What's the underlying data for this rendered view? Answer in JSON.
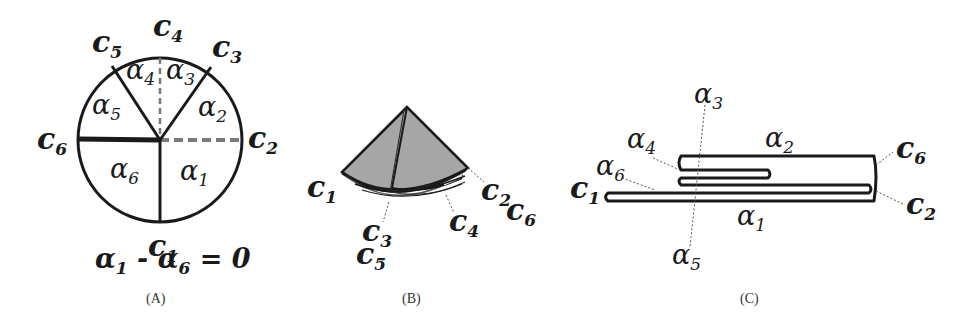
{
  "panels": {
    "a": {
      "caption": "(A)",
      "corner_labels": [
        {
          "base": "c",
          "sub": "1"
        },
        {
          "base": "c",
          "sub": "2"
        },
        {
          "base": "c",
          "sub": "3"
        },
        {
          "base": "c",
          "sub": "4"
        },
        {
          "base": "c",
          "sub": "5"
        },
        {
          "base": "c",
          "sub": "6"
        }
      ],
      "angle_labels": [
        {
          "base": "α",
          "sub": "1"
        },
        {
          "base": "α",
          "sub": "2"
        },
        {
          "base": "α",
          "sub": "3"
        },
        {
          "base": "α",
          "sub": "4"
        },
        {
          "base": "α",
          "sub": "5"
        },
        {
          "base": "α",
          "sub": "6"
        }
      ],
      "equation": {
        "lhs_a": "α",
        "lhs_a_sub": "1",
        "minus": " - ",
        "lhs_b": "α",
        "lhs_b_sub": "6",
        "rhs": " = 0"
      }
    },
    "b": {
      "caption": "(B)",
      "labels": [
        {
          "base": "c",
          "sub": "1"
        },
        {
          "base": "c",
          "sub": "2"
        },
        {
          "base": "c",
          "sub": "6"
        },
        {
          "base": "c",
          "sub": "3"
        },
        {
          "base": "c",
          "sub": "5"
        },
        {
          "base": "c",
          "sub": "4"
        }
      ]
    },
    "c": {
      "caption": "(C)",
      "labels": [
        {
          "base": "α",
          "sub": "3"
        },
        {
          "base": "α",
          "sub": "4"
        },
        {
          "base": "α",
          "sub": "2"
        },
        {
          "base": "α",
          "sub": "6"
        },
        {
          "base": "α",
          "sub": "1"
        },
        {
          "base": "α",
          "sub": "5"
        },
        {
          "base": "c",
          "sub": "1"
        },
        {
          "base": "c",
          "sub": "6"
        },
        {
          "base": "c",
          "sub": "2"
        }
      ]
    }
  },
  "colors": {
    "ink": "#1a1a1a",
    "fill_gray": "#a6a6a6",
    "dashed_gray": "#7a7a7a"
  }
}
